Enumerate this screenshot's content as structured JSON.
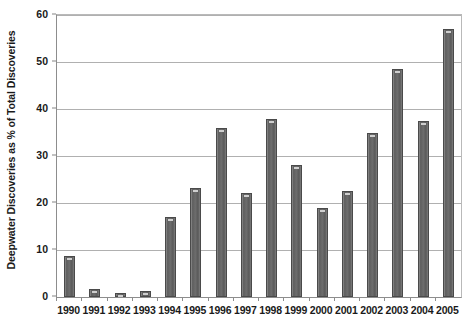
{
  "chart_data": {
    "type": "bar",
    "title": "",
    "subtitle": "",
    "xlabel": "",
    "ylabel": "Deepwater Discoveries as % of Total Discoveries",
    "ylim": [
      0,
      60
    ],
    "ytick_values": [
      60,
      50,
      40,
      30,
      20,
      10,
      0
    ],
    "ytick_labels": [
      "60",
      "50",
      "40",
      "30",
      "20",
      "10",
      "0"
    ],
    "grid": true,
    "legend": null,
    "categories": [
      "1990",
      "1991",
      "1992",
      "1993",
      "1994",
      "1995",
      "1996",
      "1997",
      "1998",
      "1999",
      "2000",
      "2001",
      "2002",
      "2003",
      "2004",
      "2005"
    ],
    "values": [
      8.8,
      1.6,
      0.8,
      1.2,
      17.0,
      23.2,
      36.0,
      22.2,
      37.8,
      28.0,
      18.9,
      22.6,
      34.9,
      48.5,
      37.4,
      57.0
    ],
    "series": [
      {
        "name": "Deepwater Discoveries",
        "values": [
          8.8,
          1.6,
          0.8,
          1.2,
          17.0,
          23.2,
          36.0,
          22.2,
          37.8,
          28.0,
          18.9,
          22.6,
          34.9,
          48.5,
          37.4,
          57.0
        ]
      }
    ],
    "bar_color": "#6d6d6d",
    "bar_edge_color": "#4a4a4a",
    "gridline_color": "#b0b0b0",
    "axis_color": "#8d8d8d",
    "text_color": "#1a1a1a",
    "background_color": "#ffffff"
  }
}
